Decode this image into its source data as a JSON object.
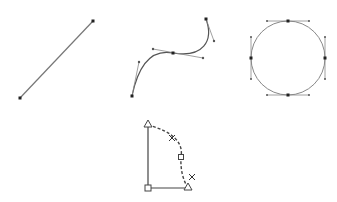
{
  "diagram": {
    "colors": {
      "path": "#666666",
      "anchor": "#222222",
      "handle": "#555555",
      "shape": "#444444"
    },
    "straight_line": {
      "label": "straight-line-path",
      "start": [
        20,
        98
      ],
      "end": [
        93,
        21
      ]
    },
    "bezier_curve": {
      "label": "bezier-curve-path",
      "anchors": [
        {
          "point": [
            132,
            96
          ],
          "handle_out": [
            139,
            62
          ]
        },
        {
          "point": [
            173,
            53
          ],
          "handle_in": [
            153,
            49
          ],
          "handle_out": [
            203,
            58
          ]
        },
        {
          "point": [
            206,
            19
          ],
          "handle_in": [
            214,
            41
          ]
        }
      ]
    },
    "circle": {
      "label": "circle-path",
      "center": [
        288,
        58
      ],
      "radius": 37,
      "handle_length": 21
    },
    "quarter_shape": {
      "label": "quarter-circle-shape",
      "top": [
        148,
        125
      ],
      "corner": [
        148,
        188
      ],
      "right": [
        188,
        188
      ],
      "arc_mid": [
        181,
        157
      ],
      "markers": [
        [
          172,
          138
        ],
        [
          192,
          177
        ]
      ]
    }
  }
}
